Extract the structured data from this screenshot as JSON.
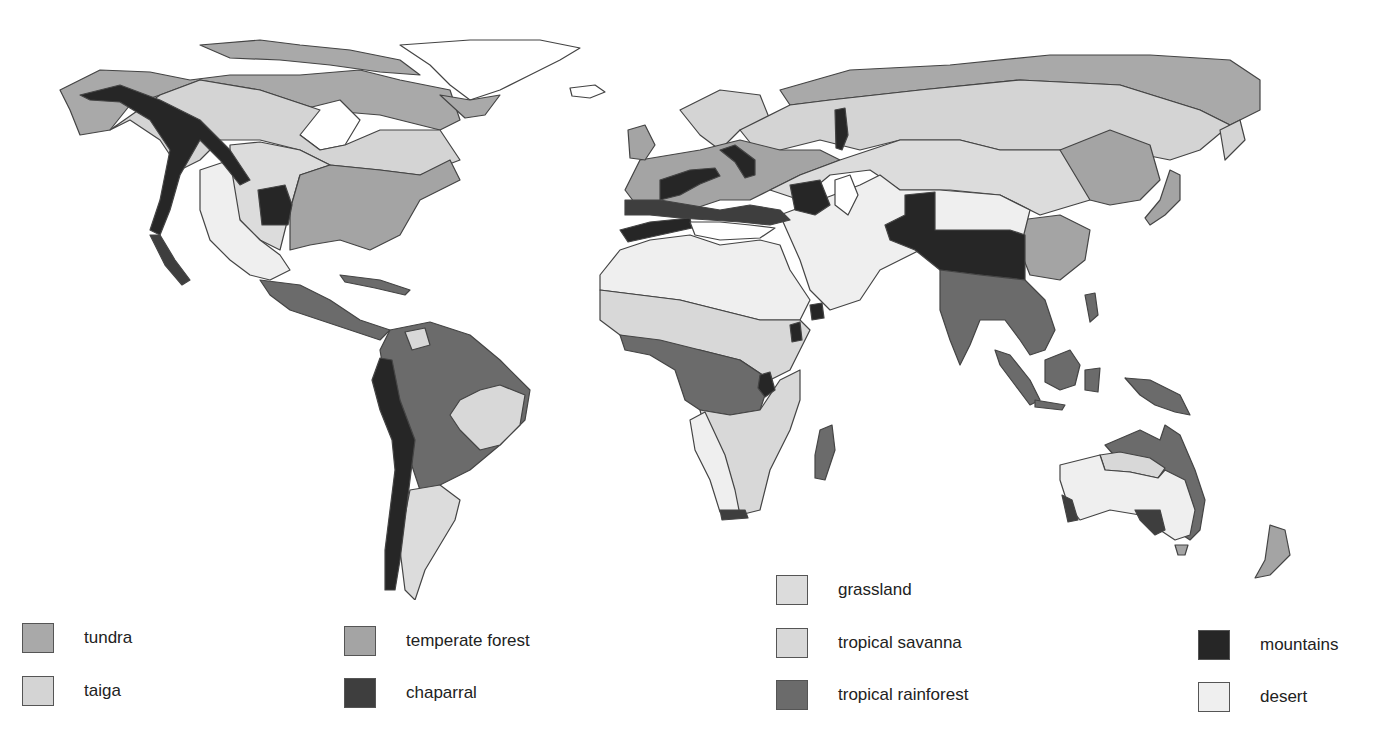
{
  "map": {
    "title": "World Biomes",
    "colors": {
      "tundra": "#a9a9a9",
      "taiga": "#d4d4d4",
      "temperate_forest": "#a4a4a4",
      "chaparral": "#3e3e3e",
      "grassland": "#dcdcdc",
      "tropical_savanna": "#d8d8d8",
      "tropical_rainforest": "#6b6b6b",
      "mountains": "#262626",
      "desert": "#efefef",
      "ice": "#ffffff"
    }
  },
  "legend": {
    "items": [
      {
        "key": "tundra",
        "label": "tundra"
      },
      {
        "key": "taiga",
        "label": "taiga"
      },
      {
        "key": "temperate_forest",
        "label": "temperate forest"
      },
      {
        "key": "chaparral",
        "label": "chaparral"
      },
      {
        "key": "grassland",
        "label": "grassland"
      },
      {
        "key": "tropical_savanna",
        "label": "tropical savanna"
      },
      {
        "key": "tropical_rainforest",
        "label": "tropical rainforest"
      },
      {
        "key": "mountains",
        "label": "mountains"
      },
      {
        "key": "desert",
        "label": "desert"
      }
    ]
  }
}
